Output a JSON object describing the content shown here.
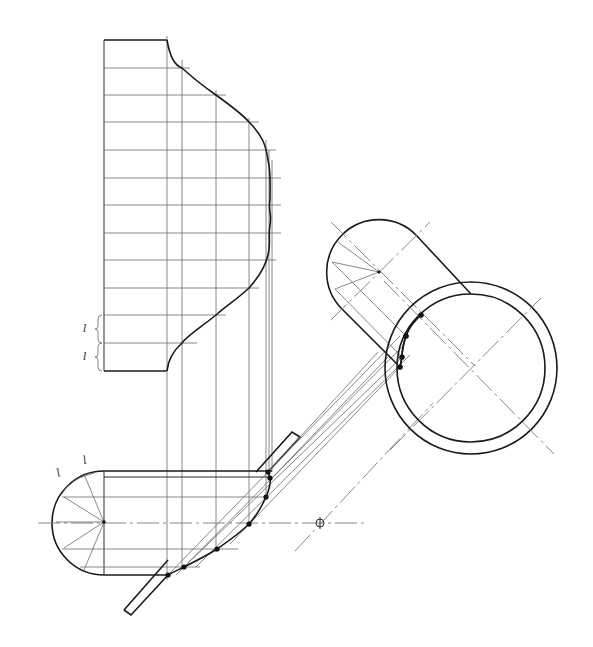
{
  "figure": {
    "type": "technical-drawing",
    "width": 593,
    "height": 647,
    "stroke_color": "#1a1a1a",
    "background": "#ffffff"
  },
  "header_ghost": "",
  "labels": {
    "segment_label": "l",
    "left_braces": [
      {
        "text": "l",
        "x": 82,
        "y": 320
      },
      {
        "text": "l",
        "x": 82,
        "y": 349
      }
    ],
    "arc_labels": [
      {
        "text": "l",
        "x": 57,
        "y": 477
      },
      {
        "text": "l",
        "x": 85,
        "y": 463
      }
    ]
  },
  "profile_view": {
    "left_x": 104,
    "top_y": 40,
    "bottom_y": 371,
    "top_edge_end_x": 167,
    "grid_verticals_x": [
      167,
      182,
      216,
      249,
      268
    ],
    "grid_horizontals_y": [
      68,
      95,
      122,
      150,
      178,
      205,
      233,
      260,
      288,
      315,
      343
    ],
    "grid_horizontal_ends_x": [
      190,
      226,
      259,
      276,
      281,
      281,
      276,
      266,
      226,
      197,
      0
    ]
  },
  "elbow_view": {
    "center": [
      104,
      522
    ],
    "radius": 52,
    "top_y": 471,
    "bottom_y": 575,
    "right_x": 272,
    "radial_angles_deg": [
      -112,
      -68,
      -30,
      0,
      30,
      68,
      112
    ]
  },
  "intersection_points_lower": [
    [
      168,
      575
    ],
    [
      184,
      567
    ],
    [
      217,
      549
    ],
    [
      249,
      524
    ],
    [
      266,
      497
    ],
    [
      270,
      478
    ],
    [
      268,
      472
    ]
  ],
  "intersection_points_upper": [
    [
      421,
      315
    ],
    [
      406,
      336
    ],
    [
      402,
      357
    ],
    [
      400,
      367
    ]
  ],
  "branch_cap": {
    "center": [
      379,
      272
    ],
    "radius": 52,
    "axis_angle_deg": 45
  },
  "main_pipe": {
    "center": [
      471,
      368
    ],
    "inner_radius": 74,
    "outer_radius": 86
  },
  "centre_mark": {
    "x": 320,
    "y": 523,
    "symbol": "circle-cross"
  }
}
